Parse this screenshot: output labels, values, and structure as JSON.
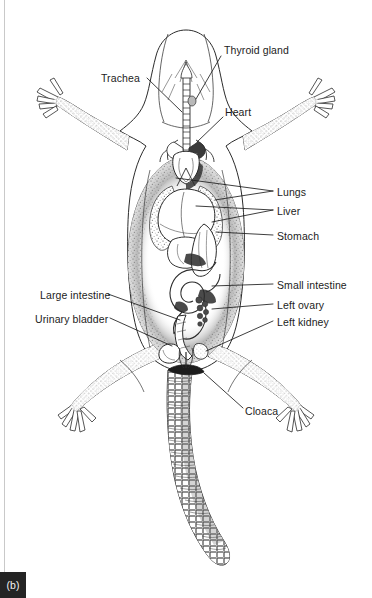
{
  "figure": {
    "panel_tag": "(b)",
    "caption_side": "bottom-left",
    "background_color": "#ffffff",
    "ink_color": "#1c1c1c",
    "page_edge_color": "#c9c9c9"
  },
  "labels": [
    {
      "id": "thyroid-gland",
      "text": "Thyroid gland",
      "side": "right",
      "x": 224,
      "y": 50,
      "leader": [
        [
          221,
          56
        ],
        [
          196,
          88
        ]
      ]
    },
    {
      "id": "trachea",
      "text": "Trachea",
      "side": "left",
      "x": 101,
      "y": 72,
      "leader": [
        [
          147,
          81
        ],
        [
          182,
          112
        ]
      ]
    },
    {
      "id": "heart",
      "text": "Heart",
      "side": "right",
      "x": 225,
      "y": 113,
      "leader": [
        [
          223,
          119
        ],
        [
          196,
          137
        ]
      ]
    },
    {
      "id": "lungs",
      "text": "Lungs",
      "side": "right",
      "x": 276,
      "y": 188,
      "leader": [
        [
          273,
          193
        ],
        [
          176,
          178
        ]
      ]
    },
    {
      "id": "liver",
      "text": "Liver",
      "side": "right",
      "x": 276,
      "y": 207,
      "leader": [
        [
          273,
          212
        ],
        [
          196,
          205
        ]
      ]
    },
    {
      "id": "stomach",
      "text": "Stomach",
      "side": "right",
      "x": 276,
      "y": 232,
      "leader": [
        [
          273,
          237
        ],
        [
          214,
          229
        ]
      ]
    },
    {
      "id": "small-intestine",
      "text": "Small intestine",
      "side": "right",
      "x": 276,
      "y": 281,
      "leader": [
        [
          273,
          286
        ],
        [
          212,
          284
        ]
      ]
    },
    {
      "id": "left-ovary",
      "text": "Left ovary",
      "side": "right",
      "x": 276,
      "y": 301,
      "leader": [
        [
          273,
          306
        ],
        [
          214,
          303
        ]
      ]
    },
    {
      "id": "left-kidney",
      "text": "Left kidney",
      "side": "right",
      "x": 276,
      "y": 318,
      "leader": [
        [
          273,
          323
        ],
        [
          205,
          348
        ]
      ]
    },
    {
      "id": "large-intestine",
      "text": "Large intestine",
      "side": "left",
      "x": 40,
      "y": 291,
      "leader": [
        [
          108,
          296
        ],
        [
          178,
          318
        ]
      ]
    },
    {
      "id": "urinary-bladder",
      "text": "Urinary bladder",
      "side": "left",
      "x": 35,
      "y": 315,
      "leader": [
        [
          110,
          320
        ],
        [
          171,
          345
        ]
      ]
    },
    {
      "id": "cloaca",
      "text": "Cloaca",
      "side": "right",
      "x": 245,
      "y": 407,
      "leader": [
        [
          243,
          410
        ],
        [
          205,
          374
        ]
      ]
    }
  ],
  "anatomy_parts": [
    "head",
    "trachea",
    "thyroid-gland",
    "heart",
    "left-lung",
    "right-lung",
    "liver",
    "stomach",
    "small-intestine",
    "large-intestine",
    "left-ovary",
    "left-kidney",
    "urinary-bladder",
    "cloaca",
    "forelimb-left",
    "forelimb-right",
    "hindlimb-left",
    "hindlimb-right",
    "tail"
  ]
}
